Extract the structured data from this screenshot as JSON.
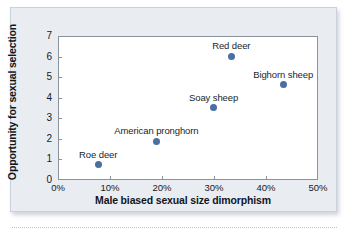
{
  "chart_data": {
    "type": "scatter",
    "title": "",
    "xlabel": "Male biased sexual size dimorphism",
    "ylabel": "Opportunity for sexual selection",
    "xlim": [
      0,
      50
    ],
    "ylim": [
      0,
      7
    ],
    "xticks": [
      "0%",
      "10%",
      "20%",
      "30%",
      "40%",
      "50%"
    ],
    "xtick_values": [
      0,
      10,
      20,
      30,
      40,
      50
    ],
    "yticks": [
      "0",
      "1",
      "2",
      "3",
      "4",
      "5",
      "6",
      "7"
    ],
    "ytick_values": [
      0,
      1,
      2,
      3,
      4,
      5,
      6,
      7
    ],
    "grid": false,
    "legend": "none",
    "marker_color": "#4a6fa5",
    "points": [
      {
        "label": "Roe deer",
        "x": 7.7,
        "y": 0.75
      },
      {
        "label": "American pronghorn",
        "x": 18.9,
        "y": 1.88
      },
      {
        "label": "Soay sheep",
        "x": 29.9,
        "y": 3.52
      },
      {
        "label": "Red deer",
        "x": 33.3,
        "y": 6.02
      },
      {
        "label": "Bighorn sheep",
        "x": 43.3,
        "y": 4.63
      }
    ]
  },
  "colors": {
    "panel_background": "#e9edf2",
    "plot_background": "#ffffff",
    "axis_line": "#8a929c",
    "marker": "#4a6fa5",
    "text": "#15191f"
  }
}
